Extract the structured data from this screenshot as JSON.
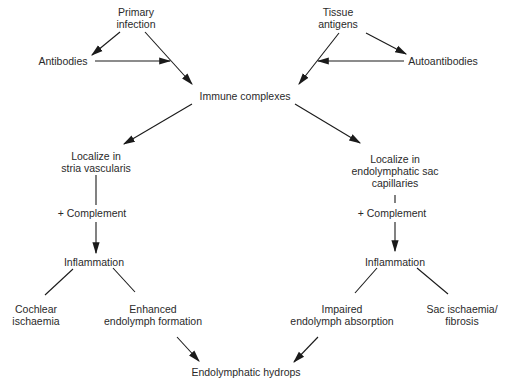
{
  "diagram": {
    "type": "flowchart",
    "nodes": {
      "primary_infection": {
        "line1": "Primary",
        "line2": "infection"
      },
      "tissue_antigens": {
        "line1": "Tissue",
        "line2": "antigens"
      },
      "antibodies": {
        "line1": "Antibodies"
      },
      "autoantibodies": {
        "line1": "Autoantibodies"
      },
      "immune_complexes": {
        "line1": "Immune complexes"
      },
      "localize_stria": {
        "line1": "Localize in",
        "line2": "stria vascularis"
      },
      "localize_sac": {
        "line1": "Localize in",
        "line2": "endolymphatic sac",
        "line3": "capillaries"
      },
      "complement_left": {
        "line1": "+ Complement"
      },
      "complement_right": {
        "line1": "+ Complement"
      },
      "inflammation_left": {
        "line1": "Inflammation"
      },
      "inflammation_right": {
        "line1": "Inflammation"
      },
      "cochlear_ischaemia": {
        "line1": "Cochlear",
        "line2": "ischaemia"
      },
      "enhanced_formation": {
        "line1": "Enhanced",
        "line2": "endolymph formation"
      },
      "impaired_absorption": {
        "line1": "Impaired",
        "line2": "endolymph absorption"
      },
      "sac_ischaemia": {
        "line1": "Sac ischaemia/",
        "line2": "fibrosis"
      },
      "endolymphatic_hydrops": {
        "line1": "Endolymphatic hydrops"
      }
    },
    "edges": [
      {
        "from": "primary_infection",
        "to": "antibodies",
        "arrow": true
      },
      {
        "from": "primary_infection",
        "to": "immune_complexes",
        "arrow": true
      },
      {
        "from": "antibodies",
        "to": "primary_infection->immune_complexes",
        "arrow": true
      },
      {
        "from": "tissue_antigens",
        "to": "autoantibodies",
        "arrow": true
      },
      {
        "from": "tissue_antigens",
        "to": "immune_complexes",
        "arrow": true
      },
      {
        "from": "autoantibodies",
        "to": "tissue_antigens->immune_complexes",
        "arrow": true
      },
      {
        "from": "immune_complexes",
        "to": "localize_stria",
        "arrow": true
      },
      {
        "from": "immune_complexes",
        "to": "localize_sac",
        "arrow": true
      },
      {
        "from": "localize_stria",
        "to": "complement_left",
        "arrow": false
      },
      {
        "from": "complement_left",
        "to": "inflammation_left",
        "arrow": true
      },
      {
        "from": "localize_sac",
        "to": "complement_right",
        "arrow": false
      },
      {
        "from": "complement_right",
        "to": "inflammation_right",
        "arrow": true
      },
      {
        "from": "inflammation_left",
        "to": "cochlear_ischaemia",
        "arrow": false
      },
      {
        "from": "inflammation_left",
        "to": "enhanced_formation",
        "arrow": false
      },
      {
        "from": "inflammation_right",
        "to": "impaired_absorption",
        "arrow": false
      },
      {
        "from": "inflammation_right",
        "to": "sac_ischaemia",
        "arrow": false
      },
      {
        "from": "enhanced_formation",
        "to": "endolymphatic_hydrops",
        "arrow": true
      },
      {
        "from": "impaired_absorption",
        "to": "endolymphatic_hydrops",
        "arrow": true
      }
    ],
    "colors": {
      "ink": "#2a2a2a",
      "background": "#ffffff"
    }
  }
}
